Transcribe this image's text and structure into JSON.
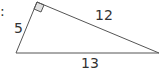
{
  "diagram": {
    "type": "right-triangle",
    "edge_marker": ":",
    "sides": {
      "left": "5",
      "hypotenuse_top": "12",
      "base": "13"
    },
    "right_angle_at": "top vertex",
    "colors": {
      "stroke": "#555555",
      "right_angle_fill": "#e0e0e0",
      "text": "#333333"
    }
  }
}
